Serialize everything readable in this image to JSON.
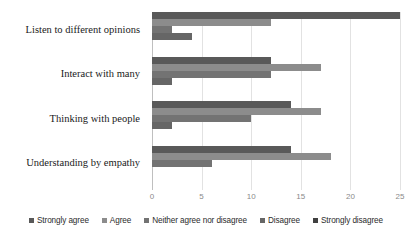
{
  "chart_data": {
    "type": "bar",
    "orientation": "horizontal",
    "title": "",
    "subtitle": "",
    "xlabel": "",
    "ylabel": "",
    "xlim": [
      0,
      25
    ],
    "xticks": [
      0,
      5,
      10,
      15,
      20,
      25
    ],
    "xtick_labels": [
      "0",
      "5",
      "10",
      "15",
      "20",
      "25"
    ],
    "grid": true,
    "legend_position": "bottom",
    "categories": [
      "Listen to different opinions",
      "Interact with many",
      "Thinking with people",
      "Understanding by empathy"
    ],
    "series": [
      {
        "name": "Strongly agree",
        "color": "#595959",
        "values": [
          25,
          12,
          14,
          14
        ]
      },
      {
        "name": "Agree",
        "color": "#8c8c8c",
        "values": [
          12,
          17,
          17,
          18
        ]
      },
      {
        "name": "Neither agree nor disagree",
        "color": "#737373",
        "values": [
          2,
          12,
          10,
          6
        ]
      },
      {
        "name": "Disagree",
        "color": "#666666",
        "values": [
          4,
          2,
          2,
          0
        ]
      },
      {
        "name": "Strongly disagree",
        "color": "#404040",
        "values": [
          0,
          0,
          0,
          0
        ]
      }
    ]
  },
  "colors": {
    "gridline": "#e2e2e2",
    "axis": "#bfbfbf",
    "tick_text": "#8a8a8a",
    "category_text": "#1a1a1a",
    "legend_text": "#2b2b2b",
    "background": "#ffffff"
  },
  "legend": {
    "items": [
      {
        "label": "Strongly agree",
        "color": "#595959"
      },
      {
        "label": "Agree",
        "color": "#8c8c8c"
      },
      {
        "label": "Neither agree nor disagree",
        "color": "#737373"
      },
      {
        "label": "Disagree",
        "color": "#666666"
      },
      {
        "label": "Strongly disagree",
        "color": "#404040"
      }
    ]
  }
}
